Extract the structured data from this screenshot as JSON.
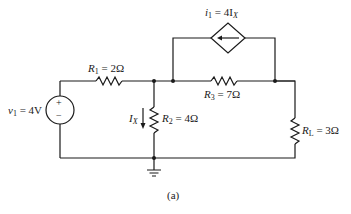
{
  "figure": {
    "caption": "(a)",
    "wire_color": "#1a1a1a"
  },
  "components": {
    "v1": {
      "symbol": "v",
      "sub": "1",
      "eq": " = 4V",
      "plus": "+",
      "minus": "−"
    },
    "r1": {
      "symbol": "R",
      "sub": "1",
      "eq": " = 2Ω"
    },
    "r2": {
      "symbol": "R",
      "sub": "2",
      "eq": " = 4Ω"
    },
    "r3": {
      "symbol": "R",
      "sub": "3",
      "eq": " = 7Ω"
    },
    "rl": {
      "symbol": "R",
      "sub": "L",
      "eq": " = 3Ω"
    },
    "i1": {
      "symbol": "i",
      "sub": "1",
      "eq": " = 4I",
      "eq_sub": "X"
    },
    "ix": {
      "symbol": "I",
      "sub": "X"
    }
  }
}
